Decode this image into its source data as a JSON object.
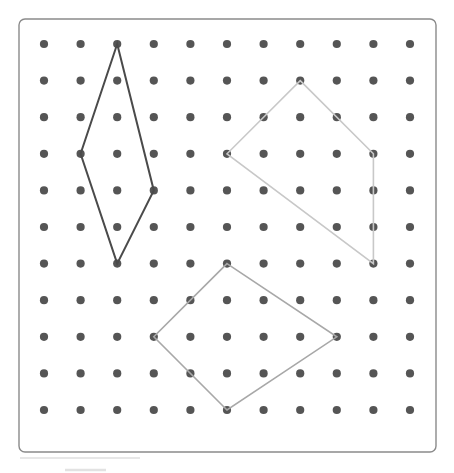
{
  "board": {
    "title": "Geoboard",
    "frame": {
      "x": 19,
      "y": 19,
      "width": 417,
      "height": 433,
      "rx": 6,
      "fill_color": "#ffffff",
      "border_color": "#8a8a8a",
      "border_width": 1.4
    },
    "grid": {
      "columns": 11,
      "rows": 11,
      "origin_x": 44,
      "origin_y": 44,
      "spacing": 36.6,
      "peg_radius": 4.1,
      "peg_color": "#555555"
    }
  },
  "shapes": [
    {
      "name": "dark-rhombus",
      "label": "Rhombus (dark)",
      "color": "#4a4a4a",
      "stroke_width": 2.0,
      "closed": true,
      "vertices": [
        {
          "col": 2,
          "row": 0
        },
        {
          "col": 3,
          "row": 4
        },
        {
          "col": 2,
          "row": 6
        },
        {
          "col": 1,
          "row": 3
        }
      ]
    },
    {
      "name": "light-kite",
      "label": "Kite (light gray)",
      "color": "#c8c8c8",
      "stroke_width": 1.6,
      "closed": true,
      "vertices": [
        {
          "col": 7,
          "row": 1
        },
        {
          "col": 9,
          "row": 3
        },
        {
          "col": 9,
          "row": 6
        },
        {
          "col": 5,
          "row": 3
        }
      ]
    },
    {
      "name": "medium-quadrilateral",
      "label": "Quadrilateral (medium gray)",
      "color": "#a8a8a8",
      "stroke_width": 1.6,
      "closed": true,
      "vertices": [
        {
          "col": 5,
          "row": 6
        },
        {
          "col": 8,
          "row": 8
        },
        {
          "col": 5,
          "row": 10
        },
        {
          "col": 3,
          "row": 8
        }
      ]
    }
  ],
  "artifacts": [
    {
      "name": "footer-rule",
      "x1": 20,
      "y1": 458,
      "x2": 140,
      "y2": 458,
      "style": "thin"
    },
    {
      "name": "footer-mark",
      "x1": 65,
      "y1": 470,
      "x2": 106,
      "y2": 470,
      "style": "thick"
    }
  ],
  "chart_data": {
    "type": "scatter",
    "xlabel": "",
    "ylabel": "",
    "xlim": [
      0,
      10
    ],
    "ylim": [
      0,
      10
    ],
    "grid": true,
    "legend": "none",
    "lattice_points_x": [
      0,
      1,
      2,
      3,
      4,
      5,
      6,
      7,
      8,
      9,
      10
    ],
    "lattice_points_y": [
      0,
      1,
      2,
      3,
      4,
      5,
      6,
      7,
      8,
      9,
      10
    ],
    "series": [
      {
        "name": "Rhombus (dark)",
        "color": "#4a4a4a",
        "x": [
          2,
          3,
          2,
          1,
          2
        ],
        "y": [
          0,
          4,
          6,
          3,
          0
        ]
      },
      {
        "name": "Kite (light gray)",
        "color": "#c8c8c8",
        "x": [
          7,
          9,
          9,
          5,
          7
        ],
        "y": [
          1,
          3,
          6,
          3,
          1
        ]
      },
      {
        "name": "Quadrilateral (medium gray)",
        "color": "#a8a8a8",
        "x": [
          5,
          8,
          5,
          3,
          5
        ],
        "y": [
          6,
          8,
          10,
          8,
          6
        ]
      }
    ]
  }
}
